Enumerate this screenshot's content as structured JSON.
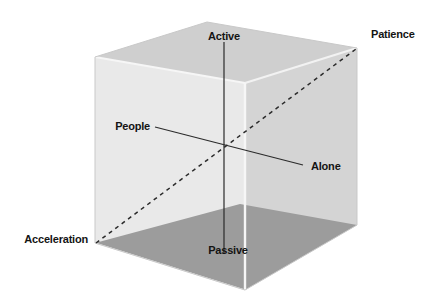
{
  "diagram": {
    "type": "3d-axis-cube",
    "background_color": "#ffffff",
    "cube": {
      "face_left_color": "#e9e9e9",
      "face_right_color": "#d4d4d4",
      "face_back_top_color": "#cfcfcf",
      "floor_color": "#9c9c9c",
      "edge_color": "#f4f4f4",
      "outline_color": "#c8c8c8"
    },
    "axes": [
      {
        "id": "vertical",
        "name": "active-passive-axis",
        "style": "solid",
        "color": "#2b2b2b",
        "positive_label": "Active",
        "negative_label": "Passive"
      },
      {
        "id": "horizontal",
        "name": "people-alone-axis",
        "style": "solid",
        "color": "#2b2b2b",
        "positive_label": "People",
        "negative_label": "Alone"
      },
      {
        "id": "diagonal",
        "name": "patience-acceleration-axis",
        "style": "dashed",
        "color": "#2b2b2b",
        "positive_label": "Patience",
        "negative_label": "Acceleration"
      }
    ],
    "labels": {
      "active": "Active",
      "passive": "Passive",
      "people": "People",
      "alone": "Alone",
      "patience": "Patience",
      "acceleration": "Acceleration"
    }
  }
}
